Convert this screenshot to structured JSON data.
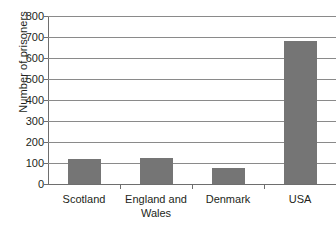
{
  "chart_data": {
    "type": "bar",
    "title": "",
    "xlabel": "",
    "ylabel": "Number of prisoners",
    "categories": [
      "Scotland",
      "England and Wales",
      "Denmark",
      "USA"
    ],
    "category_lines": [
      [
        "Scotland"
      ],
      [
        "England and",
        "Wales"
      ],
      [
        "Denmark"
      ],
      [
        "USA"
      ]
    ],
    "values": [
      117,
      122,
      74,
      680
    ],
    "ylim": [
      0,
      800
    ],
    "yticks": [
      0,
      100,
      200,
      300,
      400,
      500,
      600,
      700,
      800
    ],
    "ytick_labels": [
      "0",
      "100",
      "200",
      "300",
      "400",
      "500",
      "600",
      "700",
      "800"
    ],
    "grid": true,
    "legend": "none",
    "series": [
      {
        "name": "Number of prisoners",
        "values": [
          117,
          122,
          74,
          680
        ]
      }
    ],
    "colors": {
      "bar_fill": "#757575",
      "axis": "#6e6e6e",
      "gridline": "#8a8a8a",
      "text": "#231f20",
      "background": "#ffffff"
    }
  }
}
